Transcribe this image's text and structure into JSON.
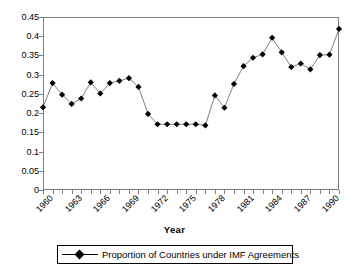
{
  "chart_data": {
    "type": "line",
    "title": "",
    "xlabel": "Year",
    "ylabel": "",
    "grid": false,
    "legend_position": "bottom",
    "xlim": [
      1960,
      1991
    ],
    "ylim": [
      0,
      0.45
    ],
    "ytick_step": 0.05,
    "xtick_step": 1,
    "xtick_label_step": 3,
    "ytick_labels": [
      "0.45",
      "0.4",
      "0.35",
      "0.3",
      "0.25",
      "0.2",
      "0.15",
      "0.1",
      "0.05",
      "0"
    ],
    "ytick_values": [
      0.45,
      0.4,
      0.35,
      0.3,
      0.25,
      0.2,
      0.15,
      0.1,
      0.05,
      0
    ],
    "xtick_labels": [
      "1960",
      "1963",
      "1966",
      "1969",
      "1972",
      "1975",
      "1978",
      "1981",
      "1984",
      "1987",
      "1990"
    ],
    "xtick_values": [
      1960,
      1963,
      1966,
      1969,
      1972,
      1975,
      1978,
      1981,
      1984,
      1987,
      1990
    ],
    "marker": "diamond",
    "marker_color": "#000000",
    "line_color": "#808080",
    "series": [
      {
        "name": "Proportion of Countries under IMF Agreements",
        "x": [
          1960,
          1961,
          1962,
          1963,
          1964,
          1965,
          1966,
          1967,
          1968,
          1969,
          1970,
          1971,
          1972,
          1973,
          1974,
          1975,
          1976,
          1977,
          1978,
          1979,
          1980,
          1981,
          1982,
          1983,
          1984,
          1985,
          1986,
          1987,
          1988,
          1989,
          1990,
          1991
        ],
        "values": [
          0.215,
          0.278,
          0.248,
          0.224,
          0.238,
          0.28,
          0.251,
          0.278,
          0.284,
          0.291,
          0.268,
          0.198,
          0.171,
          0.171,
          0.171,
          0.171,
          0.171,
          0.168,
          0.246,
          0.214,
          0.276,
          0.322,
          0.344,
          0.353,
          0.396,
          0.358,
          0.32,
          0.329,
          0.314,
          0.351,
          0.352,
          0.419
        ]
      }
    ]
  },
  "legend": {
    "entry": "Proportion of Countries under IMF Agreements",
    "marker_icon": "diamond-marker-icon"
  },
  "axis": {
    "x_title": "Year"
  }
}
